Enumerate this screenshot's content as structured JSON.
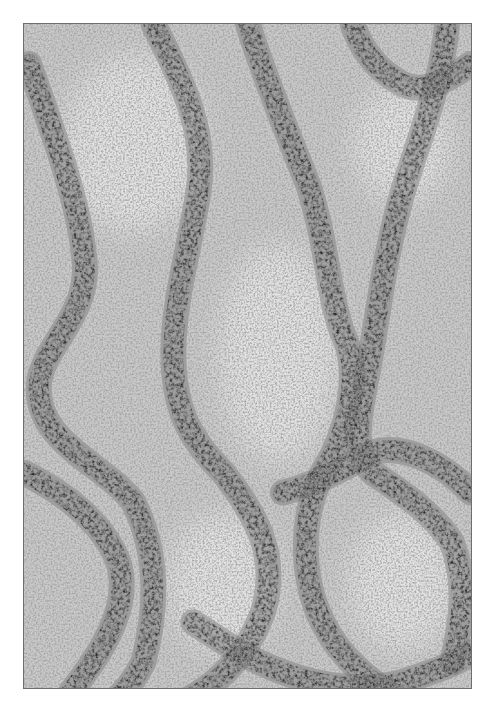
{
  "figure": {
    "type": "electron-micrograph",
    "frame": {
      "x": 23,
      "y": 23,
      "width": 449,
      "height": 666,
      "border_color": "#6e6e6e"
    },
    "colors": {
      "page_background": "#ffffff",
      "field_background": "#c9c9c9",
      "fiber_dark": "#2e2e2e",
      "fiber_mid": "#4a4a4a",
      "light_patch": "#e2e2e2"
    },
    "fibers": [
      {
        "name": "left-fiber",
        "d": "M5,40 C30,110 55,180 60,230 C70,290 20,320 15,360 C10,420 80,440 110,480 C140,540 130,600 120,640 C110,660 100,670 90,680"
      },
      {
        "name": "left-lower-fiber",
        "d": "M0,450 C40,470 80,500 95,540 C110,590 70,640 40,680"
      },
      {
        "name": "center-left-fiber",
        "d": "M130,0 C160,60 185,110 175,170 C165,230 150,280 150,330 C150,390 170,420 200,450 C240,500 255,540 240,590 C225,630 200,660 160,680"
      },
      {
        "name": "center-right-fiber",
        "d": "M225,0 C240,50 265,110 285,160 C305,220 305,270 320,310 C340,350 325,410 300,450 C275,500 280,560 300,600 C320,640 350,660 380,680"
      },
      {
        "name": "right-fiber",
        "d": "M425,0 C420,60 395,120 380,170 C360,240 355,300 345,350 C335,400 330,430 350,450 C380,470 410,490 430,520 C445,560 440,600 430,640"
      },
      {
        "name": "right-lower-fiber",
        "d": "M260,470 C300,460 330,440 350,430 C380,420 420,440 449,470"
      },
      {
        "name": "bottom-arc-fiber",
        "d": "M170,600 C200,620 230,640 260,650 C300,665 340,670 380,660 C410,650 440,640 449,630"
      },
      {
        "name": "top-right-arc-fiber",
        "d": "M330,0 C340,30 360,50 380,60 C400,70 420,60 449,40"
      }
    ],
    "light_patches": [
      {
        "cx": 110,
        "cy": 120,
        "rx": 70,
        "ry": 90
      },
      {
        "cx": 255,
        "cy": 330,
        "rx": 60,
        "ry": 110
      },
      {
        "cx": 380,
        "cy": 120,
        "rx": 50,
        "ry": 60
      },
      {
        "cx": 200,
        "cy": 560,
        "rx": 55,
        "ry": 70
      },
      {
        "cx": 380,
        "cy": 560,
        "rx": 55,
        "ry": 70
      }
    ]
  }
}
